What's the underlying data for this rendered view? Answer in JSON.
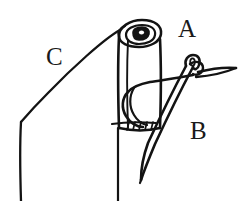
{
  "figure": {
    "type": "line-drawing",
    "background_color": "#ffffff",
    "ink_color": "#131313",
    "width": 250,
    "height": 201,
    "labels": [
      {
        "id": "A",
        "text": "A",
        "refers_to": "rolled-hem-top",
        "x": 178,
        "y": 16
      },
      {
        "id": "B",
        "text": "B",
        "refers_to": "sewing-needle",
        "x": 190,
        "y": 118
      },
      {
        "id": "C",
        "text": "C",
        "refers_to": "fabric-edge",
        "x": 46,
        "y": 44
      }
    ],
    "parts": [
      {
        "name": "fabric-roll",
        "description": "Rolled fabric tube with spiral end"
      },
      {
        "name": "roll-spiral",
        "description": "Coiled cross-section at top of roll"
      },
      {
        "name": "fabric-edge",
        "description": "Diagonal then vertical fabric edge at left"
      },
      {
        "name": "needle",
        "description": "Sewing needle angled down-left with eye at top right"
      },
      {
        "name": "thread",
        "description": "Thread looping through roll and out to the right"
      },
      {
        "name": "stitches",
        "description": "Short slanted stitch marks at base of roll"
      }
    ]
  }
}
